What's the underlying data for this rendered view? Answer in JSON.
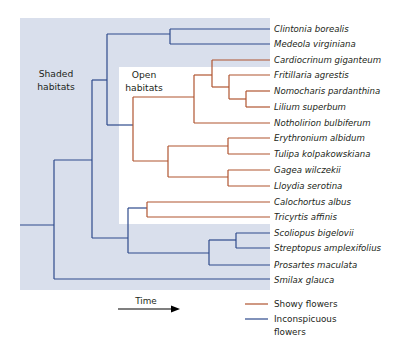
{
  "diagram": {
    "type": "phylogenetic-tree",
    "regions": {
      "shaded": {
        "label_line1": "Shaded",
        "label_line2": "habitats",
        "color": "#d9dfec"
      },
      "open": {
        "label_line1": "Open",
        "label_line2": "habitats",
        "color": "#ffffff"
      }
    },
    "colors": {
      "showy": "#b0542f",
      "inconspicuous": "#2e4a8c"
    },
    "taxa": [
      {
        "name": "Clintonia borealis",
        "trait": "inconspicuous"
      },
      {
        "name": "Medeola virginiana",
        "trait": "inconspicuous"
      },
      {
        "name": "Cardiocrinum giganteum",
        "trait": "showy"
      },
      {
        "name": "Fritillaria agrestis",
        "trait": "showy"
      },
      {
        "name": "Nomocharis pardanthina",
        "trait": "showy"
      },
      {
        "name": "Lilium superbum",
        "trait": "showy"
      },
      {
        "name": "Notholirion bulbiferum",
        "trait": "showy"
      },
      {
        "name": "Erythronium albidum",
        "trait": "showy"
      },
      {
        "name": "Tulipa kolpakowskiana",
        "trait": "showy"
      },
      {
        "name": "Gagea wilczekii",
        "trait": "showy"
      },
      {
        "name": "Lloydia serotina",
        "trait": "showy"
      },
      {
        "name": "Calochortus albus",
        "trait": "showy"
      },
      {
        "name": "Tricyrtis affinis",
        "trait": "showy"
      },
      {
        "name": "Scoliopus bigelovii",
        "trait": "inconspicuous"
      },
      {
        "name": "Streptopus amplexifolius",
        "trait": "inconspicuous"
      },
      {
        "name": "Prosartes maculata",
        "trait": "inconspicuous"
      },
      {
        "name": "Smilax glauca",
        "trait": "inconspicuous"
      }
    ],
    "axis": {
      "label": "Time"
    },
    "legend": {
      "items": [
        {
          "label": "Showy flowers",
          "color": "#b0542f"
        },
        {
          "label_line1": "Inconspicuous",
          "label_line2": "flowers",
          "color": "#2e4a8c"
        }
      ]
    }
  }
}
